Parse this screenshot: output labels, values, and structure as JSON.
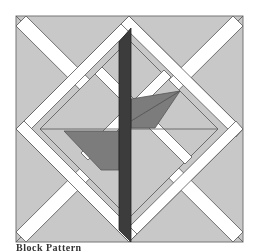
{
  "figure": {
    "caption": "Block Pattern",
    "colors": {
      "background": "#ffffff",
      "light_gray": "#c8c8c8",
      "medium_gray": "#7c7c7c",
      "dark_gray": "#3c3c3c",
      "white_strip": "#ffffff",
      "outline": "#555555"
    }
  }
}
